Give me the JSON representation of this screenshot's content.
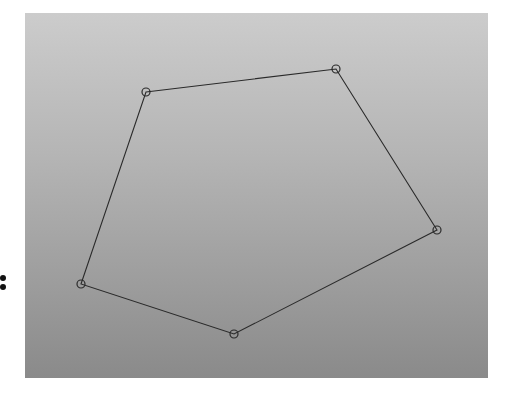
{
  "diagram": {
    "type": "polygon",
    "shape": "pentagon",
    "panel": {
      "x": 25,
      "y": 13,
      "width": 463,
      "height": 365,
      "gradient_top": "#cccccc",
      "gradient_bottom": "#8a8a8a"
    },
    "stroke_color": "#2a2a2a",
    "vertex_marker": "circle",
    "vertex_radius": 4,
    "vertices": [
      {
        "x": 146,
        "y": 92
      },
      {
        "x": 336,
        "y": 69
      },
      {
        "x": 437,
        "y": 230
      },
      {
        "x": 234,
        "y": 334
      },
      {
        "x": 81,
        "y": 284
      }
    ],
    "edges": [
      [
        0,
        1
      ],
      [
        1,
        2
      ],
      [
        2,
        3
      ],
      [
        3,
        4
      ],
      [
        4,
        0
      ]
    ]
  },
  "side_mark": {
    "glyph": ":",
    "x": 3,
    "y": 282
  }
}
